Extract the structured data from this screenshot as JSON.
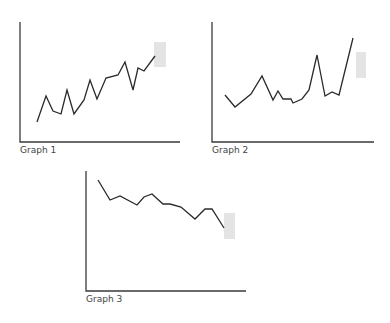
{
  "chart_data": [
    {
      "type": "line",
      "title": "Graph 1",
      "xlabel": "",
      "ylabel": "",
      "grid": false,
      "trend": "increasing",
      "points_px": [
        [
          37,
          122
        ],
        [
          46,
          96
        ],
        [
          53,
          111
        ],
        [
          61,
          114
        ],
        [
          67,
          90
        ],
        [
          74,
          114
        ],
        [
          84,
          100
        ],
        [
          90,
          80
        ],
        [
          97,
          99
        ],
        [
          106,
          78
        ],
        [
          118,
          75
        ],
        [
          125,
          62
        ],
        [
          133,
          90
        ],
        [
          138,
          68
        ],
        [
          144,
          71
        ],
        [
          155,
          56
        ]
      ],
      "highlight_box_px": [
        154,
        42,
        12,
        25
      ],
      "axes_px": {
        "origin": [
          20,
          142
        ],
        "x_end": 180,
        "y_top": 22
      }
    },
    {
      "type": "line",
      "title": "Graph 2",
      "xlabel": "",
      "ylabel": "",
      "grid": false,
      "trend": "flat then rising",
      "points_px": [
        [
          225,
          95
        ],
        [
          235,
          107
        ],
        [
          251,
          94
        ],
        [
          262,
          76
        ],
        [
          273,
          100
        ],
        [
          278,
          91
        ],
        [
          283,
          99
        ],
        [
          291,
          99
        ],
        [
          293,
          103
        ],
        [
          302,
          99
        ],
        [
          309,
          90
        ],
        [
          317,
          55
        ],
        [
          325,
          96
        ],
        [
          332,
          92
        ],
        [
          339,
          95
        ],
        [
          353,
          38
        ]
      ],
      "highlight_box_px": [
        356,
        52,
        10,
        26
      ],
      "axes_px": {
        "origin": [
          212,
          142
        ],
        "x_end": 374,
        "y_top": 22
      }
    },
    {
      "type": "line",
      "title": "Graph 3",
      "xlabel": "",
      "ylabel": "",
      "grid": false,
      "trend": "decreasing",
      "points_px": [
        [
          98,
          180
        ],
        [
          110,
          200
        ],
        [
          120,
          196
        ],
        [
          137,
          205
        ],
        [
          144,
          197
        ],
        [
          152,
          194
        ],
        [
          163,
          204
        ],
        [
          170,
          204
        ],
        [
          181,
          207
        ],
        [
          195,
          219
        ],
        [
          205,
          209
        ],
        [
          212,
          209
        ],
        [
          224,
          228
        ]
      ],
      "highlight_box_px": [
        224,
        213,
        11,
        26
      ],
      "axes_px": {
        "origin": [
          86,
          291
        ],
        "x_end": 246,
        "y_top": 171
      }
    }
  ],
  "labels": {
    "graph1": "Graph 1",
    "graph2": "Graph 2",
    "graph3": "Graph 3"
  }
}
